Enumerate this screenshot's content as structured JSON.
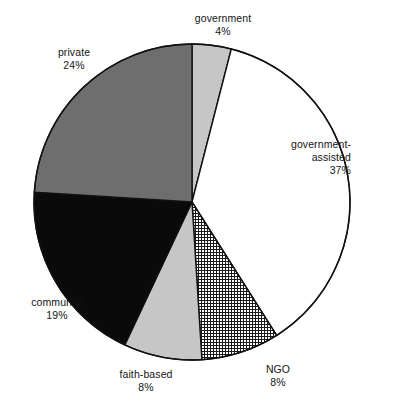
{
  "chart_data": {
    "type": "pie",
    "title": "",
    "subtitle": "",
    "xlabel": "",
    "ylabel": "",
    "legend_position": "none",
    "grid": false,
    "units": "percent",
    "total": 100,
    "start_angle_deg": 0,
    "direction": "clockwise",
    "categories": [
      "government",
      "government-assisted",
      "NGO",
      "faith-based",
      "community",
      "private"
    ],
    "values": [
      4,
      37,
      8,
      8,
      19,
      24
    ],
    "slices": [
      {
        "label": "government",
        "value": 4,
        "percent_text": "4%",
        "fill": "#c6c6c6",
        "pattern": "solid-light-gray",
        "start_deg": 0,
        "end_deg": 14.4,
        "label_align": "center"
      },
      {
        "label": "government-assisted",
        "label_line1": "government-",
        "label_line2": "assisted",
        "value": 37,
        "percent_text": "37%",
        "fill": "#ffffff",
        "pattern": "solid-white",
        "start_deg": 14.4,
        "end_deg": 147.6,
        "label_align": "right"
      },
      {
        "label": "NGO",
        "value": 8,
        "percent_text": "8%",
        "fill": "#ffffff",
        "pattern": "crosshatch-grid",
        "start_deg": 147.6,
        "end_deg": 176.4,
        "label_align": "center"
      },
      {
        "label": "faith-based",
        "value": 8,
        "percent_text": "8%",
        "fill": "#c6c6c6",
        "pattern": "solid-light-gray",
        "start_deg": 176.4,
        "end_deg": 205.2,
        "label_align": "center"
      },
      {
        "label": "community",
        "value": 19,
        "percent_text": "19%",
        "fill": "#0a0a0a",
        "pattern": "solid-black",
        "start_deg": 205.2,
        "end_deg": 273.6,
        "label_align": "center"
      },
      {
        "label": "private",
        "value": 24,
        "percent_text": "24%",
        "fill": "#6e6e6e",
        "pattern": "solid-dark-gray",
        "start_deg": 273.6,
        "end_deg": 360,
        "label_align": "center"
      }
    ],
    "geometry": {
      "center_x": 192,
      "center_y": 202,
      "radius": 158,
      "outline_color": "#111111",
      "outline_width": 1.4
    }
  },
  "labels": {
    "government": {
      "name": "government",
      "pct": "4%"
    },
    "government_assisted": {
      "name_line1": "government-",
      "name_line2": "assisted",
      "pct": "37%"
    },
    "ngo": {
      "name": "NGO",
      "pct": "8%"
    },
    "faith_based": {
      "name": "faith-based",
      "pct": "8%"
    },
    "community": {
      "name": "community",
      "pct": "19%"
    },
    "private": {
      "name": "private",
      "pct": "24%"
    }
  },
  "colors": {
    "background": "#ffffff",
    "text": "#141414",
    "outline": "#111111",
    "light_gray": "#c6c6c6",
    "dark_gray": "#6e6e6e",
    "black": "#0a0a0a",
    "white": "#ffffff"
  }
}
